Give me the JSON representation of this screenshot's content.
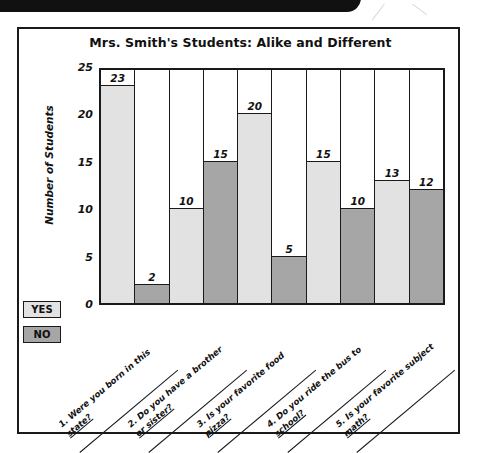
{
  "decor": {
    "top_bar": "black-edge-artifact",
    "streak": "scan-streak-artifact"
  },
  "legend": {
    "items": [
      {
        "label": "YES",
        "color": "#e2e2e2",
        "series": "yes"
      },
      {
        "label": "NO",
        "color": "#a6a6a6",
        "series": "no"
      }
    ]
  },
  "questions": [
    {
      "num": "1.",
      "line1": "Were you born in this",
      "line2": "state?"
    },
    {
      "num": "2.",
      "line1": "Do you have a brother",
      "line2": "or sister?"
    },
    {
      "num": "3.",
      "line1": "Is your favorite food",
      "line2": "pizza?"
    },
    {
      "num": "4.",
      "line1": "Do you ride the bus to",
      "line2": "school?"
    },
    {
      "num": "5.",
      "line1": "Is your favorite subject",
      "line2": "math?"
    }
  ],
  "chart_data": {
    "type": "bar",
    "title": "Mrs. Smith's Students: Alike and Different",
    "xlabel": "",
    "ylabel": "Number of Students",
    "ylim": [
      0,
      25
    ],
    "yticks": [
      25,
      20,
      15,
      10,
      5,
      0
    ],
    "grid": false,
    "legend_position": "left-below-axis",
    "categories": [
      "1. Were you born in this state?",
      "2. Do you have a brother or sister?",
      "3. Is your favorite food pizza?",
      "4. Do you ride the bus to school?",
      "5. Is your favorite subject math?"
    ],
    "series": [
      {
        "name": "YES",
        "color": "#e2e2e2",
        "values": [
          23,
          10,
          20,
          15,
          13
        ]
      },
      {
        "name": "NO",
        "color": "#a6a6a6",
        "values": [
          2,
          15,
          5,
          10,
          12
        ]
      }
    ],
    "bars": [
      {
        "label": "1-YES",
        "series": "yes",
        "value": 23
      },
      {
        "label": "1-NO",
        "series": "no",
        "value": 2
      },
      {
        "label": "2-YES",
        "series": "yes",
        "value": 10
      },
      {
        "label": "2-NO",
        "series": "no",
        "value": 15
      },
      {
        "label": "3-YES",
        "series": "yes",
        "value": 20
      },
      {
        "label": "3-NO",
        "series": "no",
        "value": 5
      },
      {
        "label": "4-YES",
        "series": "yes",
        "value": 15
      },
      {
        "label": "4-NO",
        "series": "no",
        "value": 10
      },
      {
        "label": "5-YES",
        "series": "yes",
        "value": 13
      },
      {
        "label": "5-NO",
        "series": "no",
        "value": 12
      }
    ]
  }
}
